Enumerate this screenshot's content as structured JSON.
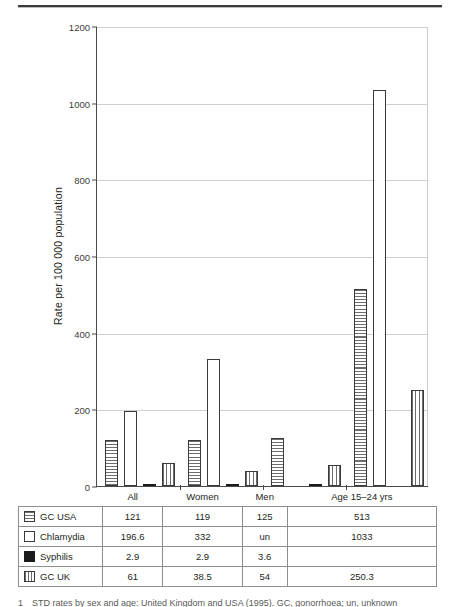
{
  "figure": {
    "caption_number": "1",
    "caption_text": "STD rates by sex and age: United Kingdom and USA (1995). GC, gonorrhoea; un, unknown"
  },
  "chart_data": {
    "type": "bar",
    "title": "",
    "xlabel": "",
    "ylabel": "Rate per 100 000 population",
    "ylim": [
      0,
      1200
    ],
    "yticks": [
      0,
      200,
      400,
      600,
      800,
      1000,
      1200
    ],
    "grid": true,
    "legend_position": "table-below",
    "categories": [
      "All",
      "Women",
      "Men",
      "Age 15–24 yrs"
    ],
    "series": [
      {
        "name": "GC  USA",
        "pattern": "horizontal-stripes",
        "values": [
          121,
          119,
          125,
          513
        ],
        "labels": [
          "121",
          "119",
          "125",
          "513"
        ]
      },
      {
        "name": "Chlamydia",
        "pattern": "white",
        "values": [
          196.6,
          332,
          null,
          1033
        ],
        "labels": [
          "196.6",
          "332",
          "un",
          "1033"
        ]
      },
      {
        "name": "Syphilis",
        "pattern": "solid-black",
        "values": [
          2.9,
          2.9,
          3.6,
          null
        ],
        "labels": [
          "2.9",
          "2.9",
          "3.6",
          ""
        ]
      },
      {
        "name": "GC  UK",
        "pattern": "vertical-stripes",
        "values": [
          61,
          38.5,
          54,
          250.3
        ],
        "labels": [
          "61",
          "38.5",
          "54",
          "250.3"
        ]
      }
    ]
  },
  "table": {
    "corner_label": "",
    "headers": [
      "All",
      "Women",
      "Men",
      "Age 15–24 yrs"
    ],
    "rows": [
      {
        "label": "GC  USA",
        "cells": [
          "121",
          "119",
          "125",
          "513"
        ]
      },
      {
        "label": "Chlamydia",
        "cells": [
          "196.6",
          "332",
          "un",
          "1033"
        ]
      },
      {
        "label": "Syphilis",
        "cells": [
          "2.9",
          "2.9",
          "3.6",
          ""
        ]
      },
      {
        "label": "GC  UK",
        "cells": [
          "61",
          "38.5",
          "54",
          "250.3"
        ]
      }
    ]
  }
}
